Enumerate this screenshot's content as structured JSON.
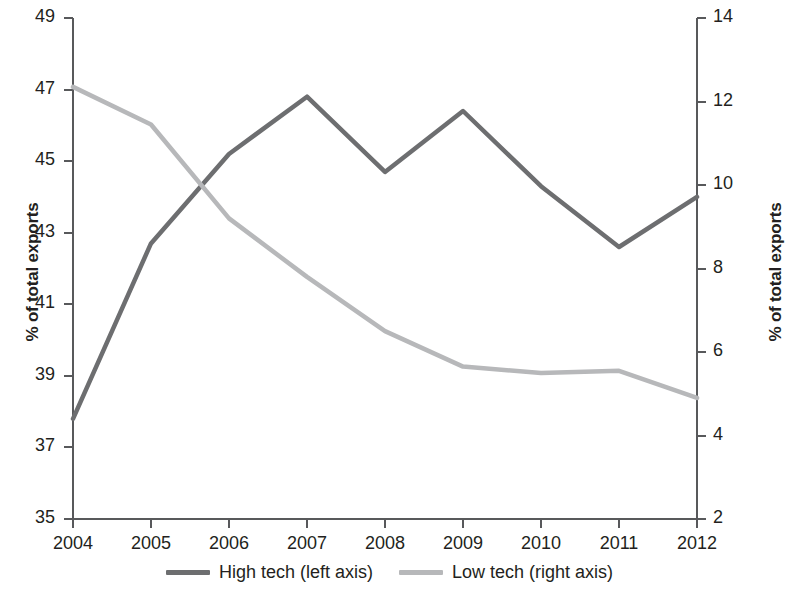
{
  "chart_data": {
    "type": "line",
    "title": "",
    "xlabel": "",
    "ylabel": "% of total exports",
    "ylabel_right": "% of total exports",
    "categories": [
      "2004",
      "2005",
      "2006",
      "2007",
      "2008",
      "2009",
      "2010",
      "2011",
      "2012"
    ],
    "ylim": [
      35,
      49
    ],
    "ylim_right": [
      2,
      14
    ],
    "yticks": [
      "49",
      "47",
      "45",
      "43",
      "41",
      "39",
      "37",
      "35"
    ],
    "yticks_right": [
      "14",
      "12",
      "10",
      "8",
      "6",
      "4",
      "2"
    ],
    "grid": false,
    "legend_position": "bottom-center",
    "series": [
      {
        "name": "High tech (left axis)",
        "axis": "left",
        "color": "#6d6e70",
        "values": [
          37.8,
          42.7,
          45.2,
          46.8,
          44.7,
          46.4,
          44.3,
          42.6,
          44.0
        ]
      },
      {
        "name": "Low tech (right axis)",
        "axis": "right",
        "color": "#b7b8ba",
        "values": [
          12.35,
          11.45,
          9.2,
          7.8,
          6.5,
          5.65,
          5.5,
          5.55,
          4.9
        ]
      }
    ]
  },
  "legend": {
    "items": [
      {
        "label": "High tech (left axis)",
        "color": "#6d6e70"
      },
      {
        "label": "Low tech (right axis)",
        "color": "#b7b8ba"
      }
    ]
  },
  "axes": {
    "left_title": "% of total exports",
    "right_title": "% of total exports"
  }
}
